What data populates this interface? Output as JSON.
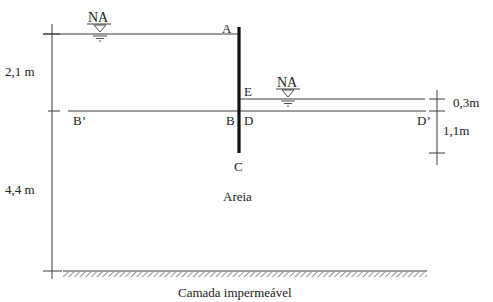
{
  "labels": {
    "na_top": "NA",
    "na_right": "NA",
    "point_a": "A",
    "point_b": "B",
    "point_b_prime": "B’",
    "point_c": "C",
    "point_d": "D",
    "point_d_prime": "D’",
    "point_e": "E",
    "soil": "Areia",
    "base_layer": "Camada impermeável"
  },
  "dimensions": {
    "left_upper": "2,1 m",
    "left_lower": "4,4 m",
    "right_upper": "0,3m",
    "right_lower": "1,1m"
  },
  "colors": {
    "line": "#3a3a3a",
    "sheet_pile": "#111111",
    "hatch": "#555555"
  }
}
